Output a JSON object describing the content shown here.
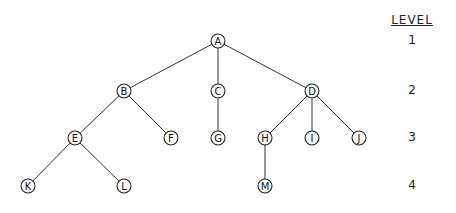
{
  "diagram": {
    "type": "tree",
    "level_header": "LEVEL",
    "levels": [
      {
        "label": "1",
        "y": 41
      },
      {
        "label": "2",
        "y": 91
      },
      {
        "label": "3",
        "y": 138
      },
      {
        "label": "4",
        "y": 186
      }
    ],
    "nodes": [
      {
        "id": "A",
        "x": 218,
        "y": 41
      },
      {
        "id": "B",
        "x": 124,
        "y": 91
      },
      {
        "id": "C",
        "x": 218,
        "y": 91
      },
      {
        "id": "D",
        "x": 312,
        "y": 91
      },
      {
        "id": "E",
        "x": 75,
        "y": 138
      },
      {
        "id": "F",
        "x": 171,
        "y": 138
      },
      {
        "id": "G",
        "x": 218,
        "y": 138
      },
      {
        "id": "H",
        "x": 265,
        "y": 138
      },
      {
        "id": "I",
        "x": 312,
        "y": 138
      },
      {
        "id": "J",
        "x": 359,
        "y": 138
      },
      {
        "id": "K",
        "x": 28,
        "y": 186
      },
      {
        "id": "L",
        "x": 124,
        "y": 186
      },
      {
        "id": "M",
        "x": 265,
        "y": 186
      }
    ],
    "edges": [
      [
        "A",
        "B"
      ],
      [
        "A",
        "C"
      ],
      [
        "A",
        "D"
      ],
      [
        "B",
        "E"
      ],
      [
        "B",
        "F"
      ],
      [
        "C",
        "G"
      ],
      [
        "D",
        "H"
      ],
      [
        "D",
        "I"
      ],
      [
        "D",
        "J"
      ],
      [
        "E",
        "K"
      ],
      [
        "E",
        "L"
      ],
      [
        "H",
        "M"
      ]
    ]
  }
}
